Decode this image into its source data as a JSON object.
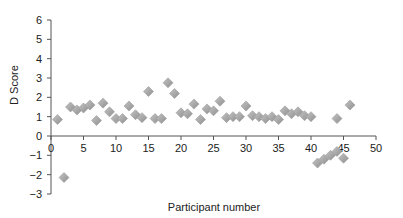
{
  "chart_data": {
    "type": "scatter",
    "title": "",
    "xlabel": "Participant number",
    "ylabel": "D Score",
    "xlim": [
      0,
      50
    ],
    "ylim": [
      -3,
      6
    ],
    "xticks": [
      0,
      5,
      10,
      15,
      20,
      25,
      30,
      35,
      40,
      45,
      50
    ],
    "yticks": [
      -3,
      -2,
      -1,
      0,
      1,
      2,
      3,
      4,
      5,
      6
    ],
    "grid": false,
    "legend": null,
    "marker": "diamond",
    "marker_color": "#a0a0a0",
    "series": [
      {
        "name": "D Score",
        "x": [
          1,
          2,
          3,
          4,
          5,
          6,
          7,
          8,
          9,
          10,
          11,
          12,
          13,
          14,
          15,
          16,
          17,
          18,
          19,
          20,
          21,
          22,
          23,
          24,
          25,
          26,
          27,
          28,
          29,
          30,
          31,
          32,
          33,
          34,
          35,
          36,
          37,
          38,
          39,
          40,
          41,
          42,
          43,
          44,
          44,
          45,
          46
        ],
        "y": [
          0.85,
          -2.15,
          1.5,
          1.35,
          1.45,
          1.6,
          0.8,
          1.7,
          1.25,
          0.9,
          0.9,
          1.55,
          1.1,
          0.95,
          2.3,
          0.9,
          0.9,
          2.75,
          2.2,
          1.2,
          1.15,
          1.65,
          0.85,
          1.4,
          1.3,
          1.8,
          0.95,
          1.0,
          1.0,
          1.55,
          1.05,
          1.0,
          0.9,
          1.0,
          0.85,
          1.3,
          1.15,
          1.25,
          1.05,
          1.0,
          -1.4,
          -1.2,
          -1.0,
          -0.8,
          0.9,
          -1.15,
          1.6
        ]
      }
    ]
  }
}
